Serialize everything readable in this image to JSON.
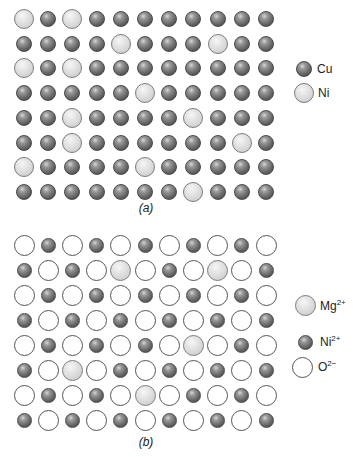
{
  "figure": {
    "panels": [
      {
        "id": "a",
        "caption": "(a)",
        "description": "Substitutional solid solution of Ni in Cu",
        "grid": {
          "rows": 8,
          "cols": 11
        },
        "species": {
          "C": {
            "label": "Cu",
            "style": "dark"
          },
          "N": {
            "label": "Ni",
            "style": "light"
          }
        },
        "lattice": [
          "NCNCCCCCCCC",
          "CCCCNCCCNCC",
          "NCNCCCCCCCC",
          "CCCCCNCCCCC",
          "CCNCCCCNCCC",
          "CCNCCCCCCNC",
          "NCCCCNCCCCC",
          "CCCCCCCNCCC"
        ],
        "legend": [
          {
            "label": "Cu",
            "superscript": "",
            "style": "dark"
          },
          {
            "label": "Ni",
            "superscript": "",
            "style": "light"
          }
        ]
      },
      {
        "id": "b",
        "caption": "(b)",
        "description": "Substitutional solid solution of Mg2+ in NiO (rock salt)",
        "grid": {
          "rows": 8,
          "cols": 11
        },
        "species": {
          "O": {
            "label": "O2-",
            "style": "white"
          },
          "N": {
            "label": "Ni2+",
            "style": "dark"
          },
          "M": {
            "label": "Mg2+",
            "style": "light"
          }
        },
        "lattice": [
          "ONONONONONO",
          "NONOMONOMON",
          "ONONONONONO",
          "NONONONONON",
          "ONONONOMONO",
          "NOMONONONON",
          "ONONOMONONO",
          "NONONONONON"
        ],
        "legend": [
          {
            "label": "Mg",
            "superscript": "2+",
            "style": "light"
          },
          {
            "label": "Ni",
            "superscript": "2+",
            "style": "dark"
          },
          {
            "label": "O",
            "superscript": "2−",
            "style": "white"
          }
        ]
      }
    ]
  }
}
